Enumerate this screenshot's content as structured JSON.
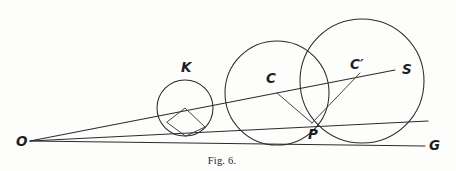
{
  "figure": {
    "caption": "Fig. 6.",
    "background_color": "#fdfdfc",
    "ink_color": "#2b2b2b",
    "width": 456,
    "height": 171,
    "labels": {
      "origin": "O",
      "small_circle": "K",
      "middle_center": "C",
      "large_center": "C′",
      "tangency": "P",
      "ray_upper_end": "S",
      "ray_lower_end": "G"
    },
    "label_positions": {
      "origin": {
        "x": 16,
        "y": 146
      },
      "small_circle": {
        "x": 181,
        "y": 72
      },
      "middle_center": {
        "x": 266,
        "y": 83
      },
      "large_center": {
        "x": 350,
        "y": 69
      },
      "tangency": {
        "x": 308,
        "y": 139
      },
      "ray_upper_end": {
        "x": 402,
        "y": 74
      },
      "ray_lower_end": {
        "x": 429,
        "y": 150
      }
    },
    "geometry": {
      "origin": {
        "x": 30,
        "y": 141
      },
      "tangency_point": {
        "x": 312,
        "y": 123
      },
      "circles": [
        {
          "name": "K",
          "cx": 185,
          "cy": 108,
          "r": 28
        },
        {
          "name": "C",
          "cx": 277,
          "cy": 93,
          "r": 52
        },
        {
          "name": "C-prime",
          "cx": 362,
          "cy": 81,
          "r": 62
        }
      ],
      "rays": [
        {
          "name": "ray-OS",
          "x1": 30,
          "y1": 141,
          "x2": 395,
          "y2": 70
        },
        {
          "name": "ray-OP",
          "x1": 30,
          "y1": 141,
          "x2": 428,
          "y2": 121
        },
        {
          "name": "ray-OG",
          "x1": 30,
          "y1": 141,
          "x2": 425,
          "y2": 146
        }
      ],
      "radii": [
        {
          "name": "radius-C-to-P",
          "x1": 277,
          "y1": 93,
          "x2": 312,
          "y2": 123
        },
        {
          "name": "radius-P-to-Cprime",
          "x1": 312,
          "y1": 123,
          "x2": 360,
          "y2": 73
        }
      ],
      "inscribed_quadrilateral": {
        "name": "K-radii-quadrilateral",
        "points": "167,122 185,108 205,127 186,136"
      }
    },
    "caption_position": {
      "x": 222,
      "y": 164
    }
  }
}
